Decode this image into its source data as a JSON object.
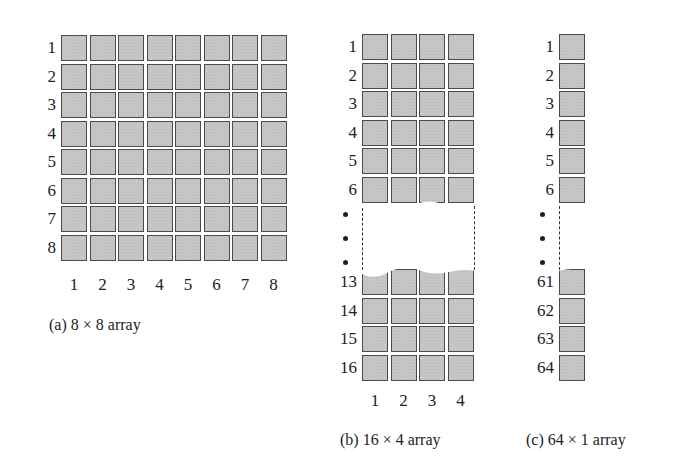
{
  "figure": {
    "panels": [
      {
        "id": "a",
        "caption": "(a) 8 × 8 array",
        "rows": 8,
        "cols": 8,
        "row_labels": [
          "1",
          "2",
          "3",
          "4",
          "5",
          "6",
          "7",
          "8"
        ],
        "col_labels": [
          "1",
          "2",
          "3",
          "4",
          "5",
          "6",
          "7",
          "8"
        ]
      },
      {
        "id": "b",
        "caption": "(b) 16 × 4 array",
        "rows": 16,
        "cols": 4,
        "row_labels_top": [
          "1",
          "2",
          "3",
          "4",
          "5",
          "6"
        ],
        "ellipsis": "•",
        "row_labels_bottom": [
          "13",
          "14",
          "15",
          "16"
        ],
        "col_labels": [
          "1",
          "2",
          "3",
          "4"
        ]
      },
      {
        "id": "c",
        "caption": "(c) 64 × 1 array",
        "rows": 64,
        "cols": 1,
        "row_labels_top": [
          "1",
          "2",
          "3",
          "4",
          "5",
          "6"
        ],
        "ellipsis": "•",
        "row_labels_bottom": [
          "61",
          "62",
          "63",
          "64"
        ]
      }
    ],
    "colors": {
      "cell_fill": "#c6c6c6",
      "cell_border": "#4a4a4a",
      "background": "#ffffff"
    }
  }
}
